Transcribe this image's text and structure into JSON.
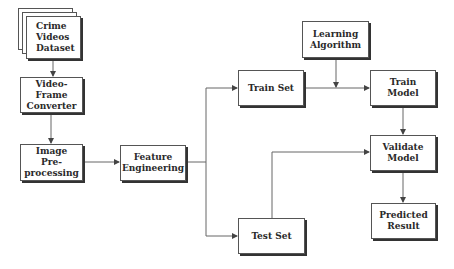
{
  "diagram": {
    "type": "flowchart",
    "nodes": {
      "crime_videos_dataset": {
        "label": "Crime Videos Dataset",
        "lines": [
          "Crime",
          "Videos",
          "Dataset"
        ],
        "shape": "stacked-documents"
      },
      "video_frame_converter": {
        "label": "Video-Frame Converter",
        "lines": [
          "Video-Frame",
          "Converter"
        ]
      },
      "image_preprocessing": {
        "label": "Image Pre-processing",
        "lines": [
          "Image Pre-",
          "processing"
        ]
      },
      "feature_engineering": {
        "label": "Feature Engineering",
        "lines": [
          "Feature",
          "Engineering"
        ]
      },
      "train_set": {
        "label": "Train Set",
        "lines": [
          "Train Set"
        ]
      },
      "test_set": {
        "label": "Test Set",
        "lines": [
          "Test Set"
        ]
      },
      "learning_algorithm": {
        "label": "Learning Algorithm",
        "lines": [
          "Learning",
          "Algorithm"
        ]
      },
      "train_model": {
        "label": "Train Model",
        "lines": [
          "Train",
          "Model"
        ]
      },
      "validate_model": {
        "label": "Validate Model",
        "lines": [
          "Validate",
          "Model"
        ]
      },
      "predicted_result": {
        "label": "Predicted Result",
        "lines": [
          "Predicted",
          "Result"
        ]
      }
    },
    "edges": [
      {
        "from": "Crime Videos Dataset",
        "to": "Video-Frame Converter"
      },
      {
        "from": "Video-Frame Converter",
        "to": "Image Pre-processing"
      },
      {
        "from": "Image Pre-processing",
        "to": "Feature Engineering"
      },
      {
        "from": "Feature Engineering",
        "to": "Train Set"
      },
      {
        "from": "Feature Engineering",
        "to": "Test Set"
      },
      {
        "from": "Train Set",
        "to": "Train Model"
      },
      {
        "from": "Learning Algorithm",
        "to": "Train Model"
      },
      {
        "from": "Train Model",
        "to": "Validate Model"
      },
      {
        "from": "Test Set",
        "to": "Validate Model"
      },
      {
        "from": "Validate Model",
        "to": "Predicted Result"
      }
    ],
    "colors": {
      "line": "#555555",
      "shadow": "#333333",
      "text": "#2a2a2a",
      "background": "#ffffff"
    }
  }
}
